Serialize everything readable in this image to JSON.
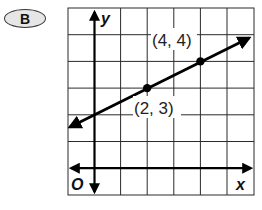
{
  "badge": {
    "label": "B"
  },
  "graph": {
    "x_axis_label": "x",
    "y_axis_label": "y",
    "origin_label": "O",
    "points": [
      {
        "label": "(2, 3)",
        "x": 2,
        "y": 3
      },
      {
        "label": "(4, 4)",
        "x": 4,
        "y": 4
      }
    ],
    "line": {
      "slope": 0.5,
      "intercept": 2
    },
    "grid": {
      "x_min": -1,
      "x_max": 6,
      "y_min": -1,
      "y_max": 6
    },
    "colors": {
      "line": "#000000",
      "grid": "#2a2a2a",
      "badge_fill": "#e6e6e6"
    }
  }
}
